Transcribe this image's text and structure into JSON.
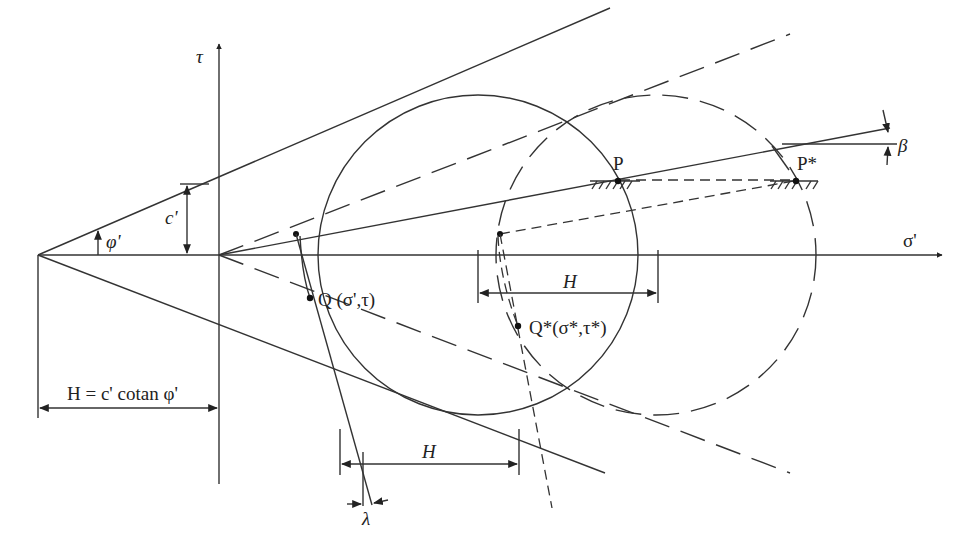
{
  "figure": {
    "type": "Mohr-Coulomb diagram with stress point translation",
    "axes": {
      "x_label": "σ'",
      "y_label": "τ"
    },
    "labels": {
      "friction_angle": "φ'",
      "cohesion": "c'",
      "H_definition": "H = c' cotan φ'",
      "H_upper": "H",
      "H_lower": "H",
      "point_P": "P",
      "point_P_star": "P*",
      "point_Q": "Q (σ',τ)",
      "point_Q_star": "Q*(σ*,τ*)",
      "beta": "β",
      "lambda": "λ"
    },
    "colors": {
      "line": "#333333",
      "text": "#222222",
      "background": "#ffffff"
    }
  }
}
